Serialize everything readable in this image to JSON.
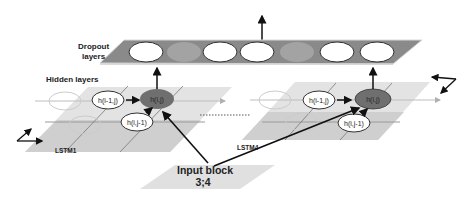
{
  "diagram": {
    "dropout_label_line1": "Dropout",
    "dropout_label_line2": "layers",
    "hidden_label": "Hidden layers",
    "lstm_left_label": "LSTM1",
    "lstm_right_label": "LSTM4",
    "input_block_line1": "Input block",
    "input_block_line2": "3;4",
    "left_grid": {
      "node_prev_row": "h(i-1,j)",
      "node_current": "h(i,j)",
      "node_prev_col": "h(i,j-1)"
    },
    "right_grid": {
      "node_prev_row": "h(i-1,j)",
      "node_current": "h(i,j)",
      "node_prev_col": "h(i,j-1)"
    },
    "dropout_units": [
      "active",
      "dropped",
      "active",
      "active",
      "dropped",
      "active",
      "active"
    ]
  },
  "colors": {
    "dropout_layer": "#8a8a8a",
    "dropped_unit": "#a3a3a3",
    "grid_light": "#e6e6e6",
    "grid_dark": "#cfcfcf",
    "current_node": "#6f6f6f",
    "arrow": "#111111"
  }
}
